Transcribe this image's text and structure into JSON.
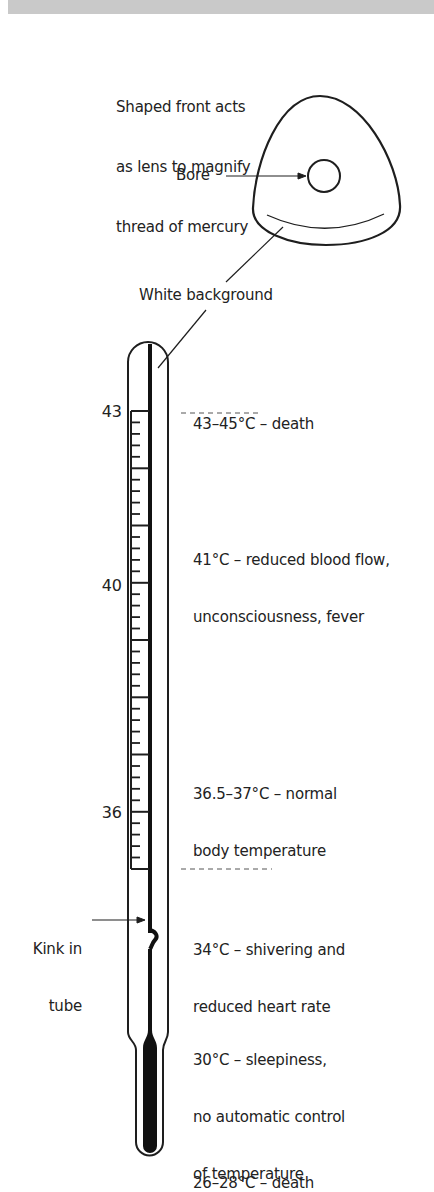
{
  "figure": {
    "lens_caption": [
      "Shaped front acts",
      "as lens to magnify",
      "thread of mercury"
    ],
    "bore_label": "Bore",
    "white_background_label": "White background",
    "kink_label": [
      "Kink in",
      "tube"
    ]
  },
  "scale": {
    "labels": [
      {
        "value": "43",
        "y": 411
      },
      {
        "value": "40",
        "y": 585
      },
      {
        "value": "36",
        "y": 812
      }
    ],
    "unit": "°C",
    "minor_step": 0.2
  },
  "effects": [
    {
      "lines": [
        "43–45°C – death"
      ]
    },
    {
      "lines": [
        "41°C – reduced blood flow,",
        "unconsciousness, fever"
      ]
    },
    {
      "lines": [
        "36.5–37°C – normal",
        "body temperature"
      ]
    },
    {
      "lines": [
        "34°C – shivering and",
        "reduced heart rate"
      ]
    },
    {
      "lines": [
        "30°C – sleepiness,",
        "no automatic control",
        "of temperature"
      ]
    },
    {
      "lines": [
        "26–28°C – death"
      ]
    }
  ],
  "colors": {
    "ink": "#1e1e1e",
    "band": "#c9c9c9",
    "mercury": "#111111"
  }
}
